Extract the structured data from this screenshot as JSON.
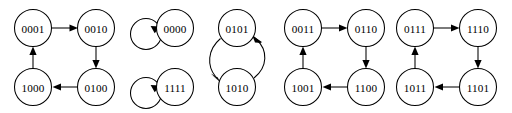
{
  "diagram": {
    "type": "state-transition-graph",
    "node_radius": 18.5,
    "stroke_color": "#000000",
    "background_color": "#ffffff",
    "components": [
      {
        "id": "component-1",
        "kind": "cycle-4",
        "nodes": [
          {
            "id": "n0001",
            "label": "0001",
            "cx": 33,
            "cy": 28
          },
          {
            "id": "n0010",
            "label": "0010",
            "cx": 96,
            "cy": 28
          },
          {
            "id": "n0100",
            "label": "0100",
            "cx": 96,
            "cy": 87
          },
          {
            "id": "n1000",
            "label": "1000",
            "cx": 33,
            "cy": 87
          }
        ],
        "edges": [
          {
            "from": "0001",
            "to": "0010",
            "style": "straight"
          },
          {
            "from": "0010",
            "to": "0100",
            "style": "straight"
          },
          {
            "from": "0100",
            "to": "1000",
            "style": "straight"
          },
          {
            "from": "1000",
            "to": "0001",
            "style": "straight"
          }
        ]
      },
      {
        "id": "component-2",
        "kind": "fixed-points",
        "nodes": [
          {
            "id": "n0000",
            "label": "0000",
            "cx": 175,
            "cy": 28
          },
          {
            "id": "n1111",
            "label": "1111",
            "cx": 175,
            "cy": 87
          }
        ],
        "edges": [
          {
            "from": "0000",
            "to": "0000",
            "style": "self-loop"
          },
          {
            "from": "1111",
            "to": "1111",
            "style": "self-loop"
          }
        ]
      },
      {
        "id": "component-3",
        "kind": "cycle-2",
        "nodes": [
          {
            "id": "n0101",
            "label": "0101",
            "cx": 237,
            "cy": 28
          },
          {
            "id": "n1010",
            "label": "1010",
            "cx": 237,
            "cy": 87
          }
        ],
        "edges": [
          {
            "from": "0101",
            "to": "1010",
            "style": "curve-left"
          },
          {
            "from": "1010",
            "to": "0101",
            "style": "curve-right"
          }
        ]
      },
      {
        "id": "component-4",
        "kind": "cycle-4",
        "nodes": [
          {
            "id": "n0011",
            "label": "0011",
            "cx": 303,
            "cy": 28
          },
          {
            "id": "n0110",
            "label": "0110",
            "cx": 366,
            "cy": 28
          },
          {
            "id": "n1100",
            "label": "1100",
            "cx": 366,
            "cy": 87
          },
          {
            "id": "n1001",
            "label": "1001",
            "cx": 303,
            "cy": 87
          }
        ],
        "edges": [
          {
            "from": "0011",
            "to": "0110",
            "style": "straight"
          },
          {
            "from": "0110",
            "to": "1100",
            "style": "straight"
          },
          {
            "from": "1100",
            "to": "1001",
            "style": "straight"
          },
          {
            "from": "1001",
            "to": "0011",
            "style": "straight"
          }
        ]
      },
      {
        "id": "component-5",
        "kind": "cycle-4",
        "nodes": [
          {
            "id": "n0111",
            "label": "0111",
            "cx": 415,
            "cy": 28
          },
          {
            "id": "n1110",
            "label": "1110",
            "cx": 478,
            "cy": 28
          },
          {
            "id": "n1101",
            "label": "1101",
            "cx": 478,
            "cy": 87
          },
          {
            "id": "n1011",
            "label": "1011",
            "cx": 415,
            "cy": 87
          }
        ],
        "edges": [
          {
            "from": "0111",
            "to": "1110",
            "style": "straight"
          },
          {
            "from": "1110",
            "to": "1101",
            "style": "straight"
          },
          {
            "from": "1101",
            "to": "1011",
            "style": "straight"
          },
          {
            "from": "1011",
            "to": "0111",
            "style": "straight"
          }
        ]
      }
    ]
  }
}
